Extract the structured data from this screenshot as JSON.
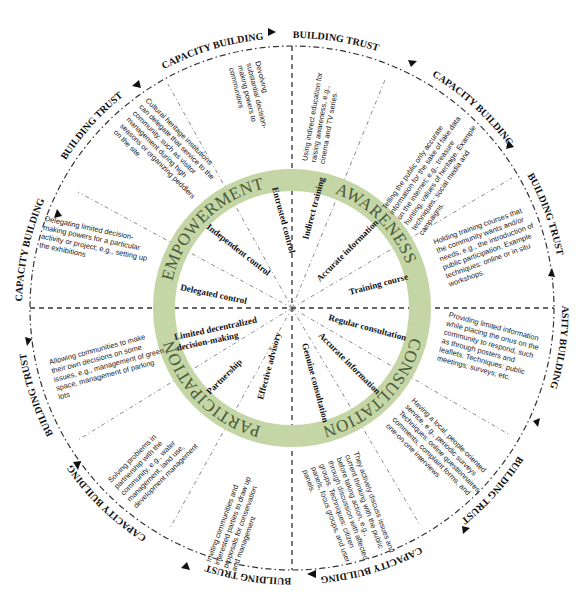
{
  "diagram": {
    "colors": {
      "ring": "#c5d6a6",
      "ring_text": "#4a5a3a",
      "lines": "#333333",
      "text": "#111111",
      "background": "#ffffff"
    },
    "center": {
      "x": 292,
      "y": 308
    },
    "quadrants": [
      {
        "name": "AWARENESS",
        "sub_levels": [
          "Indirect training",
          "Accurate information",
          "Training course"
        ],
        "descriptions": [
          "Using indirect education for raising awareness, e.g., cinema and TV series.",
          "Telling the public only accurate information for the sake of fake data on the internet; e.g., treasure hunting, values of heritage. Example techniques: social media and campaigns.",
          "Holding training courses that the community wants and/or needs, e.g., the introduction of public participation. Example techniques: online or in situ workshops."
        ]
      },
      {
        "name": "CONSULTATION",
        "sub_levels": [
          "Regular consultation",
          "Accurate information",
          "Genuine consultation"
        ],
        "descriptions": [
          "Providing limited information while placing the onus on the community to respond, such as through posters and leaflets. Techniques: public meetings; surveys; etc.",
          "Having a local, people-oriented service, e.g., periodic surveys Techniques: online questionnaires, comments, complaint forms, and one-on-one interviews",
          "They actively discuss issues and current thinking with the public before taking action, e.g., through discussion with affected groups. Techniques: citizen panels, focus groups, and user panels."
        ]
      },
      {
        "name": "PARTICIPATION",
        "sub_levels": [
          "Effective advisory",
          "Partnership",
          "Limited decentralized decision-making"
        ],
        "descriptions": [
          "Inviting communities and interested parties to draw up proposals for conservation and management",
          "Solving problems in partnership with the community, e.g., water management, land use, development management",
          "Allowing communities to make their own decisions on some issues, e.g., management of green space, management of parking lots"
        ]
      },
      {
        "name": "EMPOWERMENT",
        "sub_levels": [
          "Delegated control",
          "Independent control",
          "Entrusted control"
        ],
        "descriptions": [
          "Delegating limited decision-making powers for a particular activity or project; e.g., setting up the exhibitions",
          "Cultural heritage institutions can delegate that service to the community, such as visitor management during high seasons or organizing peddlers on the site.",
          "Devolving substantial decision-making powers to communities"
        ]
      }
    ],
    "outer_cycle": {
      "labels": [
        "BUILDING TRUST",
        "CAPACITY BUILDING",
        "BUILDING TRUST",
        "CAPASITY BUILDING",
        "BUILDING TRUST",
        "CAPACITY BUILDING",
        "BUILDING TRUST",
        "CAPACITY BUILDING",
        "BUILDING TRUST",
        "CAPACITY BUILDING",
        "BUILDING TRUST",
        "CAPACITY BUILDING"
      ]
    }
  }
}
